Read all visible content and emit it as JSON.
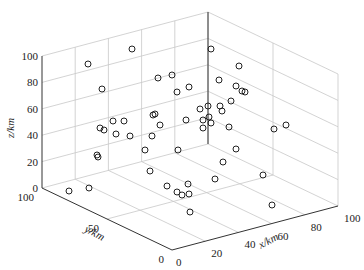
{
  "chart_data": {
    "type": "scatter3d",
    "title": "",
    "xlabel": "x/km",
    "ylabel": "y/km",
    "zlabel": "z/km",
    "xlim": [
      0,
      100
    ],
    "ylim": [
      0,
      100
    ],
    "zlim": [
      0,
      100
    ],
    "xticks": [
      "0",
      "20",
      "40",
      "60",
      "80",
      "100"
    ],
    "yticks": [
      "0",
      "50",
      "100"
    ],
    "zticks": [
      "0",
      "20",
      "40",
      "60",
      "80",
      "100"
    ],
    "grid": true,
    "marker": "open-circle",
    "marker_color": "#222222",
    "points_screen": [
      [
        132,
        49
      ],
      [
        211,
        49
      ],
      [
        88,
        64
      ],
      [
        239,
        66
      ],
      [
        158,
        78
      ],
      [
        172,
        75
      ],
      [
        219,
        80
      ],
      [
        236,
        86
      ],
      [
        242,
        91
      ],
      [
        245,
        92
      ],
      [
        189,
        87
      ],
      [
        102,
        89
      ],
      [
        231,
        101
      ],
      [
        177,
        92
      ],
      [
        153,
        115
      ],
      [
        155,
        114
      ],
      [
        200,
        109
      ],
      [
        160,
        125
      ],
      [
        208,
        106
      ],
      [
        220,
        106
      ],
      [
        113,
        121
      ],
      [
        100,
        128
      ],
      [
        124,
        121
      ],
      [
        222,
        111
      ],
      [
        186,
        120
      ],
      [
        229,
        127
      ],
      [
        203,
        120
      ],
      [
        116,
        134
      ],
      [
        209,
        117
      ],
      [
        130,
        136
      ],
      [
        104,
        130
      ],
      [
        152,
        136
      ],
      [
        211,
        123
      ],
      [
        203,
        128
      ],
      [
        274,
        129
      ],
      [
        286,
        125
      ],
      [
        97,
        155
      ],
      [
        98,
        157
      ],
      [
        145,
        150
      ],
      [
        178,
        150
      ],
      [
        236,
        149
      ],
      [
        223,
        162
      ],
      [
        150,
        171
      ],
      [
        215,
        179
      ],
      [
        188,
        184
      ],
      [
        263,
        175
      ],
      [
        69,
        191
      ],
      [
        89,
        188
      ],
      [
        167,
        186
      ],
      [
        177,
        192
      ],
      [
        182,
        195
      ],
      [
        189,
        194
      ],
      [
        190,
        212
      ],
      [
        272,
        205
      ]
    ]
  },
  "axes": {
    "z_label": "z/km",
    "y_label": "y/km",
    "x_label": "x/km"
  }
}
